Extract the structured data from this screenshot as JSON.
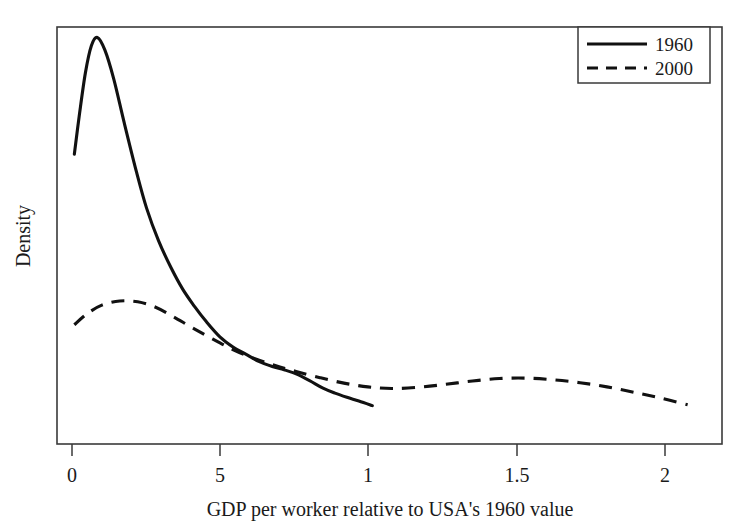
{
  "chart_data": {
    "type": "line",
    "title": "",
    "xlabel": "GDP per worker relative to USA's 1960 value",
    "ylabel": "Density",
    "xlim": [
      0,
      2.225
    ],
    "ylim": [
      0,
      1.0
    ],
    "grid": false,
    "legend_position": "top-right",
    "xticks": [
      0,
      0.5,
      1,
      1.5,
      2
    ],
    "xticklabels": [
      "0",
      "5",
      "1",
      "1.5",
      "2"
    ],
    "yticks": [],
    "yticklabels": [],
    "series": [
      {
        "name": "1960",
        "style": "solid",
        "x": [
          0.058,
          0.075,
          0.095,
          0.115,
          0.135,
          0.16,
          0.19,
          0.225,
          0.265,
          0.3,
          0.34,
          0.38,
          0.42,
          0.46,
          0.5,
          0.545,
          0.59,
          0.63,
          0.675,
          0.72,
          0.76,
          0.8,
          0.845,
          0.89,
          0.93,
          0.97,
          1.01,
          1.055
        ],
        "y": [
          0.695,
          0.79,
          0.89,
          0.955,
          0.975,
          0.945,
          0.875,
          0.77,
          0.655,
          0.565,
          0.487,
          0.425,
          0.372,
          0.33,
          0.293,
          0.257,
          0.232,
          0.216,
          0.198,
          0.186,
          0.178,
          0.168,
          0.152,
          0.134,
          0.122,
          0.112,
          0.103,
          0.092
        ]
      },
      {
        "name": "2000",
        "style": "dashed",
        "x": [
          0.058,
          0.1,
          0.15,
          0.21,
          0.27,
          0.33,
          0.39,
          0.45,
          0.52,
          0.59,
          0.66,
          0.73,
          0.8,
          0.88,
          0.96,
          1.04,
          1.12,
          1.21,
          1.3,
          1.39,
          1.48,
          1.57,
          1.66,
          1.75,
          1.84,
          1.93,
          2.02,
          2.11
        ],
        "y": [
          0.286,
          0.312,
          0.333,
          0.343,
          0.341,
          0.328,
          0.305,
          0.28,
          0.252,
          0.226,
          0.205,
          0.188,
          0.174,
          0.159,
          0.146,
          0.137,
          0.133,
          0.136,
          0.143,
          0.151,
          0.157,
          0.158,
          0.154,
          0.147,
          0.137,
          0.124,
          0.11,
          0.094
        ]
      }
    ],
    "legend_entries": [
      {
        "label": "1960",
        "style": "solid"
      },
      {
        "label": "2000",
        "style": "dashed"
      }
    ]
  },
  "axis": {
    "x_title": "GDP per worker relative to USA's 1960 value",
    "y_title": "Density",
    "tick_0": "0",
    "tick_1": "5",
    "tick_2": "1",
    "tick_3": "1.5",
    "tick_4": "2"
  },
  "legend": {
    "item_0_label": "1960",
    "item_1_label": "2000"
  },
  "colors": {
    "line": "#111111",
    "frame": "#3a3a3a",
    "background": "#ffffff"
  }
}
